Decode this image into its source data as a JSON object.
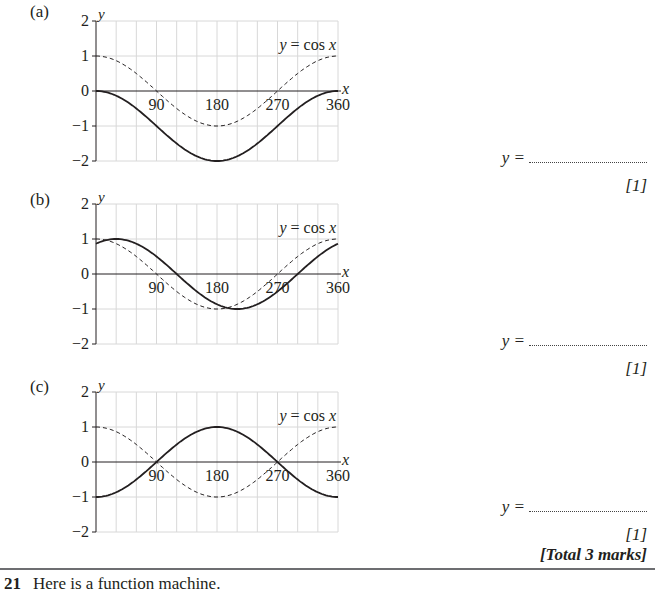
{
  "parts": [
    {
      "label": "(a)",
      "answer_prefix": "y =",
      "marks": "[1]",
      "solid_curve": "y = cos x − 1"
    },
    {
      "label": "(b)",
      "answer_prefix": "y =",
      "marks": "[1]",
      "solid_curve": "y = cos(x − 30)"
    },
    {
      "label": "(c)",
      "answer_prefix": "y =",
      "marks": "[1]",
      "solid_curve": "y = −cos x"
    }
  ],
  "total_marks": "[Total 3 marks]",
  "next_question": {
    "number": "21",
    "text": "Here is a function machine."
  },
  "axis": {
    "x_label": "x",
    "y_label": "y",
    "x_ticks": [
      "90",
      "180",
      "270",
      "360"
    ],
    "y_ticks": [
      "2",
      "1",
      "0",
      "−1",
      "−2"
    ],
    "reference_label": "y = cos x"
  },
  "chart_data": [
    {
      "type": "line",
      "title": "(a)",
      "xlabel": "x",
      "ylabel": "y",
      "xlim": [
        0,
        360
      ],
      "ylim": [
        -2,
        2
      ],
      "grid": true,
      "x": [
        0,
        30,
        60,
        90,
        120,
        150,
        180,
        210,
        240,
        270,
        300,
        330,
        360
      ],
      "series": [
        {
          "name": "y = cos x",
          "style": "dashed",
          "values": [
            1,
            0.87,
            0.5,
            0,
            -0.5,
            -0.87,
            -1,
            -0.87,
            -0.5,
            0,
            0.5,
            0.87,
            1
          ]
        },
        {
          "name": "unknown",
          "style": "solid",
          "values": [
            0,
            -0.13,
            -0.5,
            -1,
            -1.5,
            -1.87,
            -2,
            -1.87,
            -1.5,
            -1,
            -0.5,
            -0.13,
            0
          ]
        }
      ]
    },
    {
      "type": "line",
      "title": "(b)",
      "xlabel": "x",
      "ylabel": "y",
      "xlim": [
        0,
        360
      ],
      "ylim": [
        -2,
        2
      ],
      "grid": true,
      "x": [
        0,
        30,
        60,
        90,
        120,
        150,
        180,
        210,
        240,
        270,
        300,
        330,
        360
      ],
      "series": [
        {
          "name": "y = cos x",
          "style": "dashed",
          "values": [
            1,
            0.87,
            0.5,
            0,
            -0.5,
            -0.87,
            -1,
            -0.87,
            -0.5,
            0,
            0.5,
            0.87,
            1
          ]
        },
        {
          "name": "unknown",
          "style": "solid",
          "values": [
            0.87,
            1,
            0.87,
            0.5,
            0,
            -0.5,
            -0.87,
            -1,
            -0.87,
            -0.5,
            0,
            0.5,
            0.87
          ]
        }
      ]
    },
    {
      "type": "line",
      "title": "(c)",
      "xlabel": "x",
      "ylabel": "y",
      "xlim": [
        0,
        360
      ],
      "ylim": [
        -2,
        2
      ],
      "grid": true,
      "x": [
        0,
        30,
        60,
        90,
        120,
        150,
        180,
        210,
        240,
        270,
        300,
        330,
        360
      ],
      "series": [
        {
          "name": "y = cos x",
          "style": "dashed",
          "values": [
            1,
            0.87,
            0.5,
            0,
            -0.5,
            -0.87,
            -1,
            -0.87,
            -0.5,
            0,
            0.5,
            0.87,
            1
          ]
        },
        {
          "name": "unknown",
          "style": "solid",
          "values": [
            -1,
            -0.87,
            -0.5,
            0,
            0.5,
            0.87,
            1,
            0.87,
            0.5,
            0,
            -0.5,
            -0.87,
            -1
          ]
        }
      ]
    }
  ]
}
